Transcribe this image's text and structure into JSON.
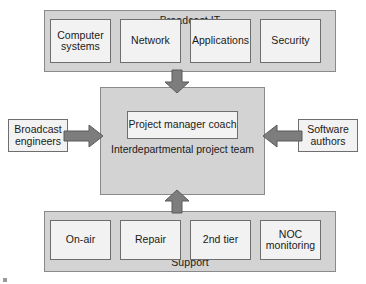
{
  "diagram": {
    "colors": {
      "band_fill": "#d3d3d3",
      "band_border": "#8a8a8a",
      "node_fill": "#f2f2f2",
      "node_border": "#6e6e6e",
      "arrow_fill": "#7d7d7d",
      "arrow_border": "#5a5a5a",
      "background": "#ffffff",
      "text": "#1a1a1a"
    },
    "top_group": {
      "title": "Broadcast IT",
      "items": [
        {
          "label": "Computer systems"
        },
        {
          "label": "Network"
        },
        {
          "label": "Applications"
        },
        {
          "label": "Security"
        }
      ]
    },
    "center": {
      "inner_label": "Project manager coach",
      "group_label": "Interdepartmental project team"
    },
    "left_group": {
      "label": "Broadcast engineers"
    },
    "right_group": {
      "label": "Software authors"
    },
    "bottom_group": {
      "title": "Support",
      "items": [
        {
          "label": "On-air"
        },
        {
          "label": "Repair"
        },
        {
          "label": "2nd tier"
        },
        {
          "label": "NOC monitoring"
        }
      ]
    },
    "arrows": [
      {
        "name": "broadcast-it-to-team",
        "direction": "down"
      },
      {
        "name": "support-to-team",
        "direction": "up"
      },
      {
        "name": "broadcast-engineers-to-team",
        "direction": "right"
      },
      {
        "name": "software-authors-to-team",
        "direction": "left"
      }
    ]
  }
}
